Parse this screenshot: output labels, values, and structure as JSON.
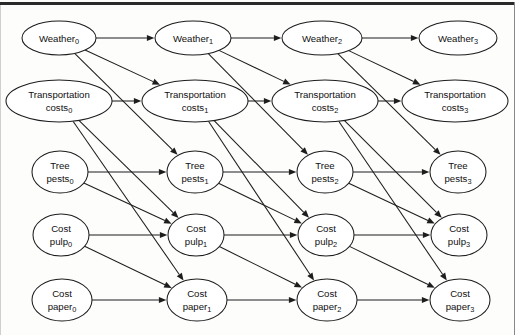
{
  "diagram": {
    "type": "directed-acyclic-graph",
    "ink_color": "#1d1d1d",
    "background_color": "#fdfdfc",
    "time_slices": [
      "0",
      "1",
      "2",
      "3"
    ],
    "variable_rows": [
      "Weather",
      "Transportation costs",
      "Tree pests",
      "Cost pulp",
      "Cost paper"
    ],
    "nodes": [
      {
        "id": "weather0",
        "base": "Weather",
        "line1": "Weather",
        "line2": "",
        "sub": "0",
        "cx": 59,
        "cy": 38,
        "rx": 37,
        "ry": 17,
        "lines": 1
      },
      {
        "id": "weather1",
        "base": "Weather",
        "line1": "Weather",
        "line2": "",
        "sub": "1",
        "cx": 193,
        "cy": 38,
        "rx": 38,
        "ry": 17,
        "lines": 1
      },
      {
        "id": "weather2",
        "base": "Weather",
        "line1": "Weather",
        "line2": "",
        "sub": "2",
        "cx": 322,
        "cy": 38,
        "rx": 40,
        "ry": 17,
        "lines": 1
      },
      {
        "id": "weather3",
        "base": "Weather",
        "line1": "Weather",
        "line2": "",
        "sub": "3",
        "cx": 458,
        "cy": 38,
        "rx": 39,
        "ry": 17,
        "lines": 1
      },
      {
        "id": "transport0",
        "base": "Transportation costs",
        "line1": "Transportation",
        "line2": "costs",
        "sub": "0",
        "cx": 59,
        "cy": 101,
        "rx": 53,
        "ry": 21,
        "lines": 2
      },
      {
        "id": "transport1",
        "base": "Transportation costs",
        "line1": "Transportation",
        "line2": "costs",
        "sub": "1",
        "cx": 195,
        "cy": 101,
        "rx": 53,
        "ry": 21,
        "lines": 2
      },
      {
        "id": "transport2",
        "base": "Transportation costs",
        "line1": "Transportation",
        "line2": "costs",
        "sub": "2",
        "cx": 325,
        "cy": 101,
        "rx": 53,
        "ry": 21,
        "lines": 2
      },
      {
        "id": "transport3",
        "base": "Transportation costs",
        "line1": "Transportation",
        "line2": "costs",
        "sub": "3",
        "cx": 455,
        "cy": 101,
        "rx": 53,
        "ry": 21,
        "lines": 2
      },
      {
        "id": "pests0",
        "base": "Tree pests",
        "line1": "Tree",
        "line2": "pests",
        "sub": "0",
        "cx": 60,
        "cy": 172,
        "rx": 28,
        "ry": 21,
        "lines": 2
      },
      {
        "id": "pests1",
        "base": "Tree pests",
        "line1": "Tree",
        "line2": "pests",
        "sub": "1",
        "cx": 195,
        "cy": 172,
        "rx": 28,
        "ry": 21,
        "lines": 2
      },
      {
        "id": "pests2",
        "base": "Tree pests",
        "line1": "Tree",
        "line2": "pests",
        "sub": "2",
        "cx": 325,
        "cy": 172,
        "rx": 28,
        "ry": 21,
        "lines": 2
      },
      {
        "id": "pests3",
        "base": "Tree pests",
        "line1": "Tree",
        "line2": "pests",
        "sub": "3",
        "cx": 458,
        "cy": 172,
        "rx": 28,
        "ry": 21,
        "lines": 2
      },
      {
        "id": "pulp0",
        "base": "Cost pulp",
        "line1": "Cost",
        "line2": "pulp",
        "sub": "0",
        "cx": 61,
        "cy": 235,
        "rx": 28,
        "ry": 21,
        "lines": 2
      },
      {
        "id": "pulp1",
        "base": "Cost pulp",
        "line1": "Cost",
        "line2": "pulp",
        "sub": "1",
        "cx": 196,
        "cy": 235,
        "rx": 28,
        "ry": 21,
        "lines": 2
      },
      {
        "id": "pulp2",
        "base": "Cost pulp",
        "line1": "Cost",
        "line2": "pulp",
        "sub": "2",
        "cx": 326,
        "cy": 235,
        "rx": 28,
        "ry": 21,
        "lines": 2
      },
      {
        "id": "pulp3",
        "base": "Cost pulp",
        "line1": "Cost",
        "line2": "pulp",
        "sub": "3",
        "cx": 459,
        "cy": 235,
        "rx": 28,
        "ry": 21,
        "lines": 2
      },
      {
        "id": "paper0",
        "base": "Cost paper",
        "line1": "Cost",
        "line2": "paper",
        "sub": "0",
        "cx": 62,
        "cy": 300,
        "rx": 30,
        "ry": 21,
        "lines": 2
      },
      {
        "id": "paper1",
        "base": "Cost paper",
        "line1": "Cost",
        "line2": "paper",
        "sub": "1",
        "cx": 197,
        "cy": 300,
        "rx": 30,
        "ry": 21,
        "lines": 2
      },
      {
        "id": "paper2",
        "base": "Cost paper",
        "line1": "Cost",
        "line2": "paper",
        "sub": "2",
        "cx": 327,
        "cy": 300,
        "rx": 30,
        "ry": 21,
        "lines": 2
      },
      {
        "id": "paper3",
        "base": "Cost paper",
        "line1": "Cost",
        "line2": "paper",
        "sub": "3",
        "cx": 460,
        "cy": 300,
        "rx": 30,
        "ry": 21,
        "lines": 2
      }
    ],
    "edges": [
      {
        "from": "weather0",
        "to": "weather1"
      },
      {
        "from": "weather0",
        "to": "transport1"
      },
      {
        "from": "weather0",
        "to": "pests1"
      },
      {
        "from": "transport0",
        "to": "transport1"
      },
      {
        "from": "transport0",
        "to": "pulp1"
      },
      {
        "from": "transport0",
        "to": "paper1"
      },
      {
        "from": "pests0",
        "to": "pests1"
      },
      {
        "from": "pests0",
        "to": "pulp1"
      },
      {
        "from": "pulp0",
        "to": "pulp1"
      },
      {
        "from": "pulp0",
        "to": "paper1"
      },
      {
        "from": "paper0",
        "to": "paper1"
      },
      {
        "from": "weather1",
        "to": "weather2"
      },
      {
        "from": "weather1",
        "to": "transport2"
      },
      {
        "from": "weather1",
        "to": "pests2"
      },
      {
        "from": "transport1",
        "to": "transport2"
      },
      {
        "from": "transport1",
        "to": "pulp2"
      },
      {
        "from": "transport1",
        "to": "paper2"
      },
      {
        "from": "pests1",
        "to": "pests2"
      },
      {
        "from": "pests1",
        "to": "pulp2"
      },
      {
        "from": "pulp1",
        "to": "pulp2"
      },
      {
        "from": "pulp1",
        "to": "paper2"
      },
      {
        "from": "paper1",
        "to": "paper2"
      },
      {
        "from": "weather2",
        "to": "weather3"
      },
      {
        "from": "weather2",
        "to": "transport3"
      },
      {
        "from": "weather2",
        "to": "pests3"
      },
      {
        "from": "transport2",
        "to": "transport3"
      },
      {
        "from": "transport2",
        "to": "pulp3"
      },
      {
        "from": "transport2",
        "to": "paper3"
      },
      {
        "from": "pests2",
        "to": "pests3"
      },
      {
        "from": "pests2",
        "to": "pulp3"
      },
      {
        "from": "pulp2",
        "to": "pulp3"
      },
      {
        "from": "pulp2",
        "to": "paper3"
      },
      {
        "from": "paper2",
        "to": "paper3"
      }
    ]
  }
}
